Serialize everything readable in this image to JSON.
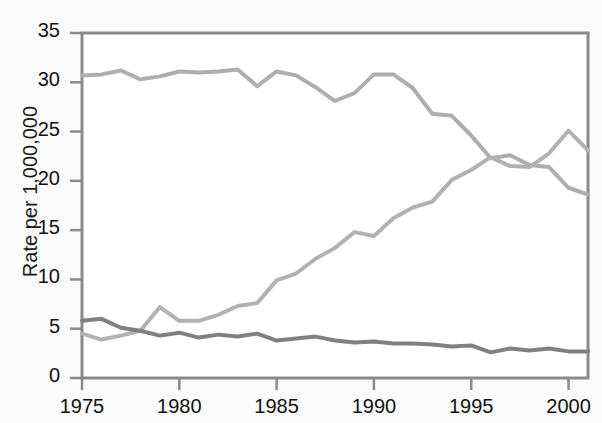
{
  "chart_data": {
    "type": "line",
    "title": "",
    "xlabel": "",
    "ylabel": "Rate per 1,000,000",
    "xlim": [
      1975,
      2001
    ],
    "ylim": [
      0,
      35
    ],
    "yticks": [
      0,
      5,
      10,
      15,
      20,
      25,
      30,
      35
    ],
    "xticks": [
      1975,
      1980,
      1985,
      1990,
      1995,
      2000
    ],
    "ytick_labels": [
      "0",
      "5",
      "10",
      "15",
      "20",
      "25",
      "30",
      "35"
    ],
    "xtick_labels": [
      "1975",
      "1980",
      "1985",
      "1990",
      "1995",
      "2000"
    ],
    "grid": false,
    "legend": "none",
    "x": [
      1975,
      1976,
      1977,
      1978,
      1979,
      1980,
      1981,
      1982,
      1983,
      1984,
      1985,
      1986,
      1987,
      1988,
      1989,
      1990,
      1991,
      1992,
      1993,
      1994,
      1995,
      1996,
      1997,
      1998,
      1999,
      2000,
      2001
    ],
    "series": [
      {
        "name": "series-declining-high",
        "color": "#aeaeae",
        "values": [
          30.7,
          30.8,
          31.2,
          30.3,
          30.6,
          31.1,
          31.0,
          31.1,
          31.3,
          29.6,
          31.1,
          30.7,
          29.5,
          28.1,
          28.9,
          30.8,
          30.8,
          29.4,
          26.8,
          26.6,
          24.6,
          22.3,
          22.6,
          21.6,
          21.4,
          19.3,
          18.6
        ]
      },
      {
        "name": "series-rising",
        "color": "#b2b2b2",
        "values": [
          4.5,
          3.9,
          4.3,
          4.8,
          7.2,
          5.8,
          5.8,
          6.4,
          7.3,
          7.6,
          9.9,
          10.6,
          12.1,
          13.2,
          14.8,
          14.4,
          16.2,
          17.3,
          17.9,
          20.1,
          21.1,
          22.4,
          21.5,
          21.4,
          22.8,
          25.1,
          23.1
        ]
      },
      {
        "name": "series-low-flat",
        "color": "#808080",
        "values": [
          5.8,
          6.0,
          5.1,
          4.8,
          4.3,
          4.6,
          4.1,
          4.4,
          4.2,
          4.5,
          3.8,
          4.0,
          4.2,
          3.8,
          3.6,
          3.7,
          3.5,
          3.5,
          3.4,
          3.2,
          3.3,
          2.6,
          3.0,
          2.8,
          3.0,
          2.7,
          2.7
        ]
      }
    ]
  },
  "axis": {
    "y_title": "Rate per 1,000,000"
  },
  "colors": {
    "frame": "#8a8a8a",
    "text": "#111111",
    "background": "#fbfbfb"
  }
}
